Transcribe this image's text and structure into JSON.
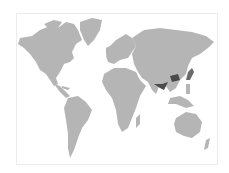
{
  "map": {
    "type": "world-choropleth",
    "colors": {
      "background": "#ffffff",
      "land": "#b5b5b5",
      "highlight_dark": "#4a4a4a",
      "highlight_medium": "#6a6a6a",
      "frame_border": "#ececec"
    },
    "highlighted_regions": [
      {
        "name": "Central China",
        "shade": "dark"
      },
      {
        "name": "Northeast India / Bangladesh",
        "shade": "dark"
      },
      {
        "name": "Japan",
        "shade": "medium"
      }
    ]
  }
}
